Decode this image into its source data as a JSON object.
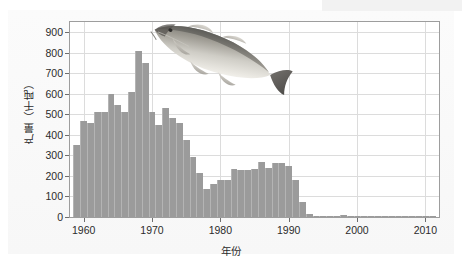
{
  "chart_data": {
    "type": "bar",
    "title": "",
    "subtitle": "",
    "xlabel": "年份",
    "ylabel": "产量（千吨）",
    "xlim": [
      1958,
      2012
    ],
    "ylim": [
      0,
      950
    ],
    "ytick_values": [
      0,
      100,
      200,
      300,
      400,
      500,
      600,
      700,
      800,
      900
    ],
    "ytick_labels": [
      "0",
      "100",
      "200",
      "300",
      "400",
      "500",
      "600",
      "700",
      "800",
      "900"
    ],
    "xtick_values": [
      1960,
      1970,
      1980,
      1990,
      2000,
      2010
    ],
    "xtick_labels": [
      "1960",
      "1970",
      "1980",
      "1990",
      "2000",
      "2010"
    ],
    "grid": true,
    "legend": null,
    "bar_color": "#9b9b9b",
    "bar_edge_color": "#b4b4b4",
    "axis_color": "#9d9d9d",
    "grid_color": "#dcdcdc",
    "text_color": "#2b2b2b",
    "plot_background": "#ffffff",
    "figure_background": "#f8f8f8",
    "annotations": [
      {
        "name": "cod-fish-illustration",
        "label": "大西洋鳕鱼",
        "x_range": [
          1980,
          1998
        ],
        "y_range": [
          560,
          880
        ]
      }
    ],
    "categories": [
      1959,
      1960,
      1961,
      1962,
      1963,
      1964,
      1965,
      1966,
      1967,
      1968,
      1969,
      1970,
      1971,
      1972,
      1973,
      1974,
      1975,
      1976,
      1977,
      1978,
      1979,
      1980,
      1981,
      1982,
      1983,
      1984,
      1985,
      1986,
      1987,
      1988,
      1989,
      1990,
      1991,
      1992,
      1993,
      1994,
      1995,
      1996,
      1997,
      1998,
      1999,
      2000,
      2001,
      2002,
      2003,
      2004,
      2005,
      2006,
      2007,
      2008,
      2009,
      2010,
      2011
    ],
    "values": [
      352,
      470,
      460,
      510,
      510,
      600,
      545,
      510,
      610,
      810,
      750,
      510,
      450,
      530,
      480,
      460,
      375,
      290,
      215,
      135,
      160,
      180,
      180,
      235,
      230,
      230,
      235,
      270,
      240,
      265,
      265,
      250,
      180,
      75,
      15,
      3,
      2,
      1,
      1,
      10,
      2,
      1,
      1,
      1,
      1,
      1,
      1,
      1,
      1,
      1,
      1,
      1,
      1
    ],
    "value_unit": "千吨",
    "notable_points": [
      {
        "year": 1968,
        "value": 810,
        "note": "峰值"
      },
      {
        "year": 1992,
        "value": 75,
        "note": "崩溃"
      },
      {
        "year": 1994,
        "value": 3,
        "note": "禁渔后接近零"
      }
    ]
  }
}
